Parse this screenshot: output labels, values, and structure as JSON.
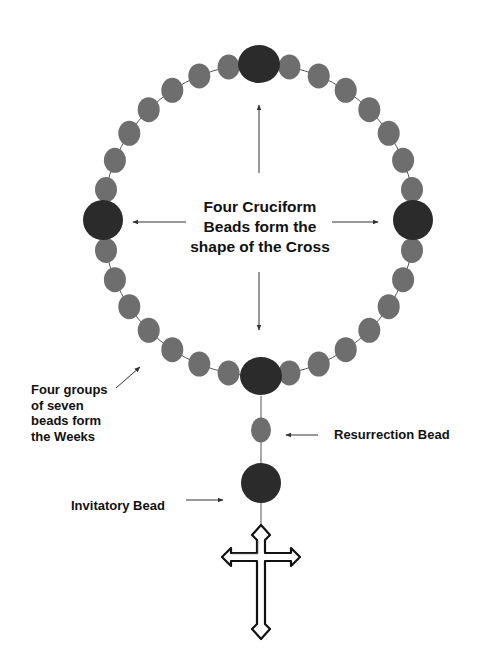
{
  "diagram": {
    "labels": {
      "center": [
        "Four Cruciform",
        "Beads form the",
        "shape of the Cross"
      ],
      "weeks": [
        "Four groups",
        "of seven",
        "beads form",
        "the Weeks"
      ],
      "resurrection": "Resurrection Bead",
      "invitatory": "Invitatory Bead"
    },
    "circle": {
      "cx": 259,
      "cy": 220,
      "r": 156
    },
    "cruciform_beads": {
      "count": 4,
      "radius": 21,
      "color": "#2b2b2b"
    },
    "week_beads": {
      "groups": 4,
      "per_group": 7,
      "rx": 11,
      "ry": 12.5,
      "color": "#6e6e6e"
    },
    "resurrection_bead": {
      "cx": 261,
      "cy": 430,
      "rx": 10,
      "ry": 12.5,
      "color": "#6e6e6e"
    },
    "invitatory_bead": {
      "cx": 261,
      "cy": 483,
      "r": 20,
      "color": "#2b2b2b"
    },
    "colors": {
      "cord": "#555555",
      "arrow": "#333333",
      "text": "#111111",
      "background": "#ffffff"
    }
  }
}
